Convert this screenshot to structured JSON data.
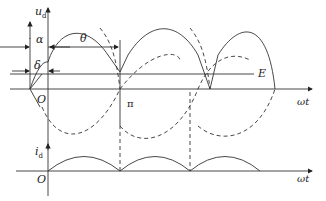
{
  "diagram": {
    "type": "waveform",
    "top_plot": {
      "y_axis_label": "u_d",
      "x_axis_label": "ωt",
      "origin_label": "O",
      "pi_label": "π",
      "emf_label": "E",
      "angle_labels": {
        "alpha": "α",
        "theta": "θ",
        "delta": "δ"
      }
    },
    "bottom_plot": {
      "y_axis_label": "i_d",
      "x_axis_label": "ωt",
      "origin_label": "O"
    }
  },
  "labels": {
    "ud_main": "u",
    "ud_sub": "d",
    "alpha": "α",
    "theta": "θ",
    "delta": "δ",
    "E": "E",
    "O_top": "O",
    "pi": "π",
    "wt_top": "ωt",
    "id_main": "i",
    "id_sub": "d",
    "O_bottom": "O",
    "wt_bottom": "ωt"
  },
  "colors": {
    "line": "#333333",
    "background": "#ffffff"
  }
}
